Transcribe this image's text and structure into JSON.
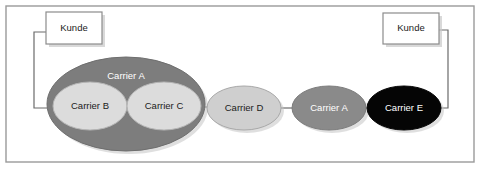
{
  "figure": {
    "background_color": "#ffffff",
    "frame": {
      "name": "outer-frame",
      "x": 6,
      "y": 6,
      "width": 468,
      "height": 156,
      "stroke": "#9a9a9a",
      "fill": "#ffffff"
    }
  },
  "colors": {
    "frame_border": "#9a9a9a",
    "box_fill": "#ffffff",
    "box_border": "#8c8c8c",
    "box_shadow": "#c9c9c9",
    "connector": "#6b6b6b",
    "carrier_a_outer": "#7d7d7d",
    "carrier_a_outer_edge": "#6e6e6e",
    "carrier_b_fill": "#dcdcdc",
    "carrier_c_fill": "#dcdcdc",
    "carrier_d_fill": "#cfcfcf",
    "carrier_a_right_fill": "#8a8a8a",
    "carrier_e_fill": "#050505",
    "ellipse_edge": "#9e9e9e",
    "text_dark": "#1b1b1b",
    "text_light": "#ffffff"
  },
  "boxes": [
    {
      "id": "kunde-left",
      "label": "Kunde",
      "x": 46,
      "y": 12,
      "width": 56,
      "height": 32,
      "text_color": "#1b1b1b"
    },
    {
      "id": "kunde-right",
      "label": "Kunde",
      "x": 383,
      "y": 13,
      "width": 56,
      "height": 31,
      "text_color": "#1b1b1b"
    }
  ],
  "ellipses": [
    {
      "id": "carrier-a-group",
      "label": "Carrier A",
      "cx": 126,
      "cy": 104,
      "rx": 79,
      "ry": 47,
      "fill": "#7d7d7d",
      "stroke": "#6e6e6e",
      "label_dy": -28,
      "text_color": "#ffffff",
      "role": "container"
    },
    {
      "id": "carrier-b",
      "label": "Carrier B",
      "cx": 90,
      "cy": 106,
      "rx": 37,
      "ry": 24,
      "fill": "#dcdcdc",
      "stroke": "#b5b5b5",
      "label_dy": 0,
      "text_color": "#1b1b1b",
      "role": "node"
    },
    {
      "id": "carrier-c",
      "label": "Carrier C",
      "cx": 164,
      "cy": 106,
      "rx": 37,
      "ry": 24,
      "fill": "#dcdcdc",
      "stroke": "#b5b5b5",
      "label_dy": 0,
      "text_color": "#1b1b1b",
      "role": "node"
    },
    {
      "id": "carrier-d",
      "label": "Carrier D",
      "cx": 244,
      "cy": 108,
      "rx": 37,
      "ry": 22,
      "fill": "#cfcfcf",
      "stroke": "#a8a8a8",
      "label_dy": 0,
      "text_color": "#1b1b1b",
      "role": "node"
    },
    {
      "id": "carrier-a-right",
      "label": "Carrier A",
      "cx": 329,
      "cy": 108,
      "rx": 37,
      "ry": 22,
      "fill": "#8a8a8a",
      "stroke": "#7c7c7c",
      "label_dy": 0,
      "text_color": "#ffffff",
      "role": "node"
    },
    {
      "id": "carrier-e",
      "label": "Carrier E",
      "cx": 404,
      "cy": 108,
      "rx": 37,
      "ry": 22,
      "fill": "#050505",
      "stroke": "#050505",
      "label_dy": 0,
      "text_color": "#ffffff",
      "role": "node"
    }
  ],
  "connectors": [
    {
      "id": "kunde-left-to-carrier-a",
      "from": "kunde-left",
      "to": "carrier-a-group",
      "points": "46,32 34,32 34,108 52,108"
    },
    {
      "id": "carrier-c-to-carrier-d",
      "from": "carrier-c",
      "to": "carrier-d",
      "points": "201,107 208,107"
    },
    {
      "id": "carrier-d-to-carrier-a-right",
      "from": "carrier-d",
      "to": "carrier-a-right",
      "points": "281,108 293,108"
    },
    {
      "id": "carrier-a-right-to-carrier-e",
      "from": "carrier-a-right",
      "to": "carrier-e",
      "points": "366,108 368,108"
    },
    {
      "id": "carrier-e-to-kunde-right",
      "from": "carrier-e",
      "to": "kunde-right",
      "points": "437,108 448,108 448,30 439,30"
    }
  ]
}
